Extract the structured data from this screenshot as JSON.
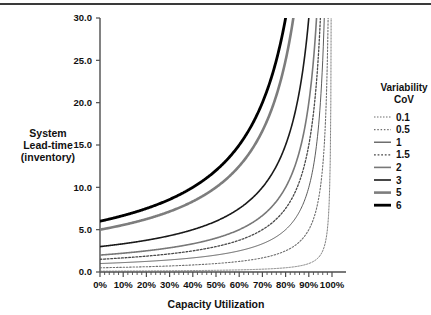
{
  "chart_data": {
    "type": "line",
    "title": "",
    "xlabel": "Capacity Utilization",
    "ylabel": "System Lead-time (inventory)",
    "ylabel_lines": [
      "System",
      "Lead-time",
      "(inventory)"
    ],
    "xlim": [
      0,
      100
    ],
    "ylim": [
      0,
      30
    ],
    "grid": false,
    "legend_position": "right",
    "legend_title_lines": [
      "Variability",
      "CoV"
    ],
    "x_tick_labels": [
      "0%",
      "10%",
      "20%",
      "30%",
      "40%",
      "50%",
      "60%",
      "70%",
      "80%",
      "90%",
      "100%"
    ],
    "x_ticks": [
      0,
      10,
      20,
      30,
      40,
      50,
      60,
      70,
      80,
      90,
      100
    ],
    "x_minor_tick_step": 2,
    "y_tick_labels": [
      "0.0",
      "5.0",
      "10.0",
      "15.0",
      "20.0",
      "25.0",
      "30.0"
    ],
    "y_ticks": [
      0,
      5,
      10,
      15,
      20,
      25,
      30
    ],
    "x": [
      0,
      5,
      10,
      15,
      20,
      25,
      30,
      35,
      40,
      45,
      50,
      55,
      60,
      65,
      70,
      75,
      80,
      85,
      90,
      92,
      94,
      95,
      96,
      97,
      98,
      99,
      99.5
    ],
    "series": [
      {
        "name": "0.1",
        "label": "0.1",
        "base_value": 0.1,
        "color": "#6f6f6f",
        "width": 0.9,
        "dash": "1.5 1.5",
        "values": [
          0.1,
          0.105,
          0.111,
          0.118,
          0.125,
          0.133,
          0.143,
          0.154,
          0.167,
          0.182,
          0.2,
          0.222,
          0.25,
          0.286,
          0.333,
          0.4,
          0.5,
          0.667,
          1.0,
          1.25,
          1.67,
          2.0,
          2.5,
          3.33,
          5.0,
          10.0,
          20.0
        ]
      },
      {
        "name": "0.5",
        "label": "0.5",
        "base_value": 0.5,
        "color": "#6f6f6f",
        "width": 1.1,
        "dash": "1.5 1.8",
        "values": [
          0.5,
          0.526,
          0.556,
          0.588,
          0.625,
          0.667,
          0.714,
          0.769,
          0.833,
          0.909,
          1.0,
          1.111,
          1.25,
          1.429,
          1.667,
          2.0,
          2.5,
          3.333,
          5.0,
          6.25,
          8.33,
          10.0,
          12.5,
          16.67,
          25.0,
          50.0,
          100.0
        ]
      },
      {
        "name": "1",
        "label": "1",
        "base_value": 1,
        "color": "#4a4a4a",
        "width": 0.9,
        "dash": "none",
        "values": [
          1.0,
          1.053,
          1.111,
          1.176,
          1.25,
          1.333,
          1.429,
          1.538,
          1.667,
          1.818,
          2.0,
          2.222,
          2.5,
          2.857,
          3.333,
          4.0,
          5.0,
          6.667,
          10.0,
          12.5,
          16.67,
          20.0,
          25.0,
          33.3,
          50.0,
          100.0,
          200.0
        ]
      },
      {
        "name": "1.5",
        "label": "1.5",
        "base_value": 1.5,
        "color": "#4a4a4a",
        "width": 1.3,
        "dash": "1.8 1.8",
        "values": [
          1.5,
          1.579,
          1.667,
          1.765,
          1.875,
          2.0,
          2.143,
          2.308,
          2.5,
          2.727,
          3.0,
          3.333,
          3.75,
          4.286,
          5.0,
          6.0,
          7.5,
          10.0,
          15.0,
          18.75,
          25.0,
          30.0,
          37.5,
          50.0,
          75.0,
          150.0,
          300.0
        ]
      },
      {
        "name": "2",
        "label": "2",
        "base_value": 2,
        "color": "#787878",
        "width": 1.6,
        "dash": "none",
        "values": [
          2.0,
          2.105,
          2.222,
          2.353,
          2.5,
          2.667,
          2.857,
          3.077,
          3.333,
          3.636,
          4.0,
          4.444,
          5.0,
          5.714,
          6.667,
          8.0,
          10.0,
          13.33,
          20.0,
          25.0,
          33.3,
          40.0,
          50.0,
          66.7,
          100.0,
          200.0,
          400.0
        ]
      },
      {
        "name": "3",
        "label": "3",
        "base_value": 3,
        "color": "#1a1a1a",
        "width": 1.6,
        "dash": "none",
        "values": [
          3.0,
          3.158,
          3.333,
          3.529,
          3.75,
          4.0,
          4.286,
          4.615,
          5.0,
          5.455,
          6.0,
          6.667,
          7.5,
          8.571,
          10.0,
          12.0,
          15.0,
          20.0,
          30.0,
          37.5,
          50.0,
          60.0,
          75.0,
          100.0,
          150.0,
          300.0,
          600.0
        ]
      },
      {
        "name": "5",
        "label": "5",
        "base_value": 5,
        "color": "#7d7d7d",
        "width": 2.6,
        "dash": "none",
        "values": [
          5.0,
          5.263,
          5.556,
          5.882,
          6.25,
          6.667,
          7.143,
          7.692,
          8.333,
          9.091,
          10.0,
          11.11,
          12.5,
          14.29,
          16.67,
          20.0,
          25.0,
          33.33,
          50.0,
          62.5,
          83.3,
          100.0,
          125.0,
          166.7,
          250.0,
          500.0,
          1000.0
        ]
      },
      {
        "name": "6",
        "label": "6",
        "base_value": 6,
        "color": "#000000",
        "width": 2.8,
        "dash": "none",
        "values": [
          6.0,
          6.316,
          6.667,
          7.059,
          7.5,
          8.0,
          8.571,
          9.231,
          10.0,
          10.91,
          12.0,
          13.33,
          15.0,
          17.14,
          20.0,
          24.0,
          30.0,
          40.0,
          60.0,
          75.0,
          100.0,
          120.0,
          150.0,
          200.0,
          300.0,
          600.0,
          1200.0
        ]
      }
    ]
  },
  "axes": {
    "x_title": "Capacity Utilization",
    "y_title_line1": "System",
    "y_title_line2": "Lead-time",
    "y_title_line3": "(inventory)"
  },
  "legend": {
    "title_line1": "Variability",
    "title_line2": "CoV"
  },
  "colors": {
    "axis": "#4d4d4d",
    "text": "#111111",
    "rule": "#3a3a3a",
    "background": "#ffffff"
  }
}
